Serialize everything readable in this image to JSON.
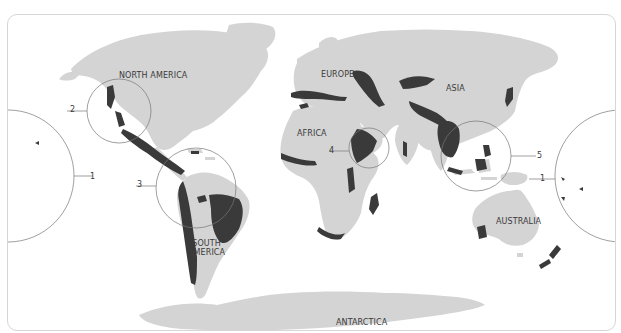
{
  "map": {
    "title": "",
    "colors": {
      "land": "#d4d4d4",
      "hotspot": "#3a3a3a",
      "callout_line": "#777777",
      "frame_border": "#d6d6d6",
      "label_text": "#3a3a3a"
    },
    "continent_labels": [
      {
        "id": "north-america",
        "text": "NORTH AMERICA"
      },
      {
        "id": "europe",
        "text": "EUROPE"
      },
      {
        "id": "asia",
        "text": "ASIA"
      },
      {
        "id": "africa",
        "text": "AFRICA"
      },
      {
        "id": "south-america",
        "text": "SOUTH\nAMERICA",
        "line1": "SOUTH",
        "line2": "AMERICA"
      },
      {
        "id": "australia",
        "text": "AUSTRALIA"
      },
      {
        "id": "antarctica",
        "text": "ANTARCTICA"
      }
    ],
    "callouts": [
      {
        "number": "1",
        "region": "Polynesia-Micronesia (Pacific)"
      },
      {
        "number": "2",
        "region": "California / Western North America"
      },
      {
        "number": "3",
        "region": "South America (Andes / Atlantic Forest)"
      },
      {
        "number": "4",
        "region": "Horn of Africa"
      },
      {
        "number": "5",
        "region": "Southeast Asia (Sundaland / Wallacea)"
      }
    ]
  }
}
